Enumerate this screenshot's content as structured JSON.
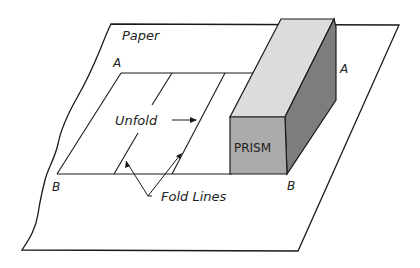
{
  "labels": {
    "paper": "Paper",
    "unfold": "Unfold",
    "fold_lines": "Fold Lines",
    "prism": "PRISM",
    "corner_a_left": "A",
    "corner_a_right": "A",
    "corner_b_left": "B",
    "corner_b_right": "B"
  },
  "colors": {
    "line": "#1a1a1a",
    "prism_top": "#d8d8d8",
    "prism_front": "#a8a8a8",
    "prism_side": "#7a7a7a"
  }
}
